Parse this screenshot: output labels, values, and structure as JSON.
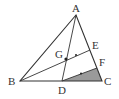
{
  "diagram": {
    "type": "triangle-geometry",
    "points": {
      "A": {
        "label": "A",
        "x": 76,
        "y": 15
      },
      "B": {
        "label": "B",
        "x": 20,
        "y": 81
      },
      "C": {
        "label": "C",
        "x": 102,
        "y": 81
      },
      "D": {
        "label": "D",
        "x": 62,
        "y": 81
      },
      "E": {
        "label": "E",
        "x": 90,
        "y": 50
      },
      "F": {
        "label": "F",
        "x": 97,
        "y": 68
      },
      "G": {
        "label": "G",
        "x": 66,
        "y": 59
      }
    },
    "segments": [
      "AB",
      "BC",
      "CA",
      "AD",
      "BE",
      "DF"
    ],
    "shaded_region": "DCF",
    "marks": [
      "GE midpoint tick",
      "DF midpoint tick"
    ],
    "colors": {
      "line": "#333333",
      "shade": "#9a9a9a",
      "background": "#ffffff"
    }
  }
}
